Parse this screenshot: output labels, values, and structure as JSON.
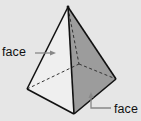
{
  "diagram": {
    "shape": "square pyramid",
    "colors": {
      "background": "#e6e6e6",
      "front_left_face": "#eeeeee",
      "front_right_face": "#9a9a9a",
      "edge": "#111111",
      "hidden_edge": "#333333",
      "arrow": "#888888"
    },
    "labels": [
      {
        "text": "face",
        "position": "left",
        "points_to": "front-left face"
      },
      {
        "text": "face",
        "position": "bottom-right",
        "points_to": "front-right face"
      }
    ]
  }
}
